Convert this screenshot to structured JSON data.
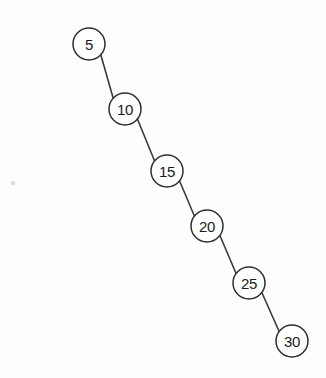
{
  "diagram": {
    "kind": "right-skewed-binary-search-tree",
    "background_color": "#fefefe",
    "node_fill_color": "#ffffff",
    "node_stroke_color": "#2e2e2e",
    "edge_stroke_color": "#3a3a3a",
    "label_color": "#1a1a1a",
    "node_radius": 16,
    "nodes": [
      {
        "id": "n5",
        "label": "5",
        "cx": 89,
        "cy": 44
      },
      {
        "id": "n10",
        "label": "10",
        "cx": 125,
        "cy": 109
      },
      {
        "id": "n15",
        "label": "15",
        "cx": 167,
        "cy": 171
      },
      {
        "id": "n20",
        "label": "20",
        "cx": 207,
        "cy": 226
      },
      {
        "id": "n25",
        "label": "25",
        "cx": 249,
        "cy": 283
      },
      {
        "id": "n30",
        "label": "30",
        "cx": 292,
        "cy": 341
      }
    ],
    "edges": [
      {
        "from": "n5",
        "to": "n10",
        "relation": "right-child"
      },
      {
        "from": "n10",
        "to": "n15",
        "relation": "right-child"
      },
      {
        "from": "n15",
        "to": "n20",
        "relation": "right-child"
      },
      {
        "from": "n20",
        "to": "n25",
        "relation": "right-child"
      },
      {
        "from": "n25",
        "to": "n30",
        "relation": "right-child"
      }
    ],
    "artifacts": [
      {
        "id": "speck-1",
        "x": 11,
        "y": 181,
        "w": 4,
        "h": 4
      }
    ]
  }
}
